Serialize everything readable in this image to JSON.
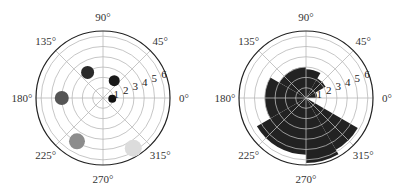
{
  "chart_data": [
    {
      "type": "scatter",
      "projection": "polar",
      "title": "",
      "angle_tick_labels": [
        "0°",
        "45°",
        "90°",
        "135°",
        "180°",
        "225°",
        "270°",
        "315°"
      ],
      "radial_tick_labels": [
        "1",
        "2",
        "3",
        "4",
        "5",
        "6"
      ],
      "rlim": [
        0,
        6.5
      ],
      "grid": true,
      "points": [
        {
          "theta_deg": 355,
          "r": 0.9,
          "size": 4,
          "color": "#111111"
        },
        {
          "theta_deg": 57,
          "r": 2.0,
          "size": 5.5,
          "color": "#1a1a1a"
        },
        {
          "theta_deg": 121,
          "r": 2.9,
          "size": 6.5,
          "color": "#2a2a2a"
        },
        {
          "theta_deg": 180,
          "r": 4.0,
          "size": 7,
          "color": "#555555"
        },
        {
          "theta_deg": 239,
          "r": 4.9,
          "size": 8,
          "color": "#8c8c8c"
        },
        {
          "theta_deg": 301,
          "r": 5.7,
          "size": 8.5,
          "color": "#dcdcdc"
        }
      ]
    },
    {
      "type": "bar",
      "projection": "polar",
      "title": "",
      "angle_tick_labels": [
        "0°",
        "45°",
        "90°",
        "135°",
        "180°",
        "225°",
        "270°",
        "315°"
      ],
      "radial_tick_labels": [
        "1",
        "2",
        "3",
        "4",
        "5",
        "6"
      ],
      "rlim": [
        0,
        6.5
      ],
      "grid": true,
      "bar_color": "#222222",
      "bars": [
        {
          "theta_start_deg": 0,
          "theta_end_deg": 30,
          "r": 1.1
        },
        {
          "theta_start_deg": 30,
          "theta_end_deg": 60,
          "r": 2.2
        },
        {
          "theta_start_deg": 60,
          "theta_end_deg": 90,
          "r": 2.8
        },
        {
          "theta_start_deg": 90,
          "theta_end_deg": 150,
          "r": 3.0
        },
        {
          "theta_start_deg": 150,
          "theta_end_deg": 210,
          "r": 4.0
        },
        {
          "theta_start_deg": 210,
          "theta_end_deg": 270,
          "r": 5.5
        },
        {
          "theta_start_deg": 270,
          "theta_end_deg": 300,
          "r": 6.3
        },
        {
          "theta_start_deg": 300,
          "theta_end_deg": 330,
          "r": 5.8
        }
      ]
    }
  ],
  "layout": {
    "plots": [
      {
        "cx": 103,
        "cy": 98,
        "radius": 67
      },
      {
        "cx": 306,
        "cy": 98,
        "radius": 67
      }
    ],
    "grid_color": "#b8b8b8",
    "axis_color": "#222222"
  }
}
